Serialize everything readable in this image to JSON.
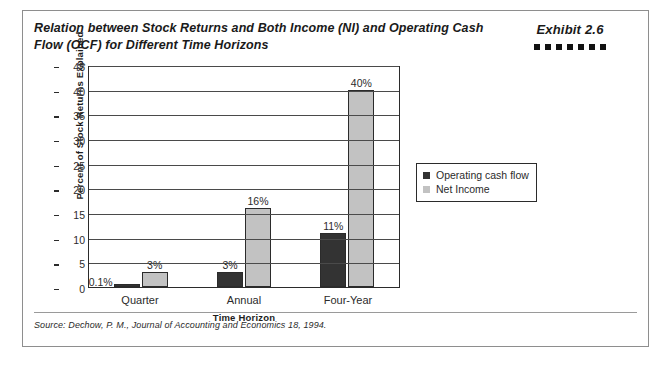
{
  "exhibit": {
    "label": "Exhibit 2.6",
    "dot_count": 7,
    "dot_color": "#111111"
  },
  "title": "Relation between Stock Returns and Both Income (NI) and Operating Cash Flow (OCF) for Different Time Horizons",
  "source": "Source: Dechow, P. M., Journal of Accounting and Economics 18, 1994.",
  "legend": {
    "items": [
      {
        "label": "Operating cash flow",
        "color": "#333333"
      },
      {
        "label": "Net Income",
        "color": "#c2c2c2"
      }
    ]
  },
  "chart_data": {
    "type": "bar",
    "title": "",
    "xlabel": "Time Horizon",
    "ylabel": "Percent of Stock Returns Explained",
    "categories": [
      "Quarter",
      "Annual",
      "Four-Year"
    ],
    "series": [
      {
        "name": "Operating cash flow",
        "color": "#333333",
        "values": [
          0.1,
          3,
          11
        ],
        "labels": [
          "0.1%",
          "3%",
          "11%"
        ]
      },
      {
        "name": "Net Income",
        "color": "#c2c2c2",
        "values": [
          3,
          16,
          40
        ],
        "labels": [
          "3%",
          "16%",
          "40%"
        ]
      }
    ],
    "ylim": [
      0,
      45
    ],
    "ytick_step": 5,
    "yticks": [
      "0",
      "5",
      "10",
      "15",
      "20",
      "25",
      "30",
      "35",
      "40",
      "45"
    ],
    "grid": true,
    "legend_position": "right"
  }
}
